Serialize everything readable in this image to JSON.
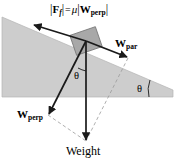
{
  "diagram": {
    "canvas": {
      "width": 180,
      "height": 162,
      "background": "#ffffff"
    },
    "colors": {
      "incline_fill": "#cdcdcd",
      "incline_stroke": "#9a9a9a",
      "block_fill": "#a8a8a8",
      "block_stroke": "#6e6e6e",
      "vector_stroke": "#1a1a1a",
      "dashed_stroke": "#9a9a9a",
      "text": "#000000"
    },
    "labels": {
      "formula": {
        "full_text": "|F_f| = μ|W_perp|",
        "bar_open": "|",
        "force_symbol": "F",
        "force_subscript": "f",
        "bar_close": "|",
        "equals": "=",
        "mu": "μ",
        "weight_symbol": "W",
        "weight_subscript": "perp"
      },
      "w_par": {
        "symbol": "W",
        "subscript": "par"
      },
      "w_perp": {
        "symbol": "W",
        "subscript": "perp"
      },
      "weight": "Weight",
      "theta_incline": "θ",
      "theta_weight": "θ"
    },
    "geometry": {
      "incline": {
        "type": "right-triangle-wedge",
        "apex_top_left": [
          2,
          17
        ],
        "bottom_left": [
          2,
          97
        ],
        "bottom_right": [
          173,
          97
        ],
        "slope_end": [
          173,
          90
        ],
        "description": "Gray wedge sloping down to the right"
      },
      "block": {
        "center": [
          86,
          41
        ],
        "width": 27,
        "height": 21,
        "rotation_deg": -19
      },
      "vectors": [
        {
          "name": "friction",
          "label": "|F_f| = μ|W_perp|",
          "from": [
            86,
            41
          ],
          "to": [
            33,
            25
          ],
          "style": "solid-arrow",
          "direction": "up-slope"
        },
        {
          "name": "w_par",
          "label": "W_par",
          "from": [
            86,
            41
          ],
          "to": [
            128,
            58
          ],
          "style": "solid-arrow",
          "direction": "down-slope"
        },
        {
          "name": "w_perp",
          "label": "W_perp",
          "from": [
            86,
            41
          ],
          "to": [
            48,
            115
          ],
          "style": "solid-arrow",
          "direction": "perpendicular-into-incline"
        },
        {
          "name": "weight",
          "label": "Weight",
          "from": [
            86,
            41
          ],
          "to": [
            86,
            141
          ],
          "style": "solid-arrow",
          "direction": "straight-down"
        }
      ],
      "dashed_lines": [
        {
          "name": "wperp-to-weight",
          "from": [
            48,
            115
          ],
          "to": [
            86,
            141
          ]
        },
        {
          "name": "wpar-to-weight",
          "from": [
            128,
            58
          ],
          "to": [
            86,
            141
          ]
        }
      ],
      "angle_marks": [
        {
          "name": "theta-at-incline-base",
          "vertex": [
            173,
            97
          ],
          "value_label": "θ"
        },
        {
          "name": "theta-between-wperp-and-weight",
          "vertex": [
            86,
            41
          ],
          "value_label": "θ"
        }
      ]
    }
  }
}
